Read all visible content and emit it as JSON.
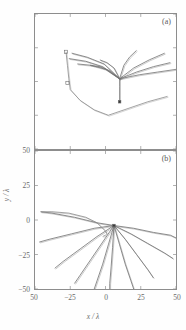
{
  "figure": {
    "panels": [
      {
        "id": "a",
        "label": "(a)"
      },
      {
        "id": "b",
        "label": "(b)"
      }
    ]
  },
  "axes": {
    "xlabel": "x / λ",
    "ylabel": "y / λ",
    "xticks": [
      "50",
      "−25",
      "0",
      "25",
      "50"
    ],
    "yticks": [
      "50",
      "25",
      "0",
      "−25",
      "−50"
    ],
    "xlim": [
      -50,
      50
    ],
    "ylim": [
      -50,
      50
    ],
    "grid": false,
    "tick_color": "#6a6a6a",
    "frame_color": "#8d8d8d"
  },
  "chart_data": {
    "type": "line",
    "title": "",
    "xlabel": "x / λ",
    "ylabel": "y / λ",
    "xlim": [
      -50,
      50
    ],
    "ylim": [
      -50,
      50
    ],
    "grid": false,
    "legend": "none",
    "panels": [
      {
        "id": "a",
        "label": "(a)",
        "source_point": {
          "x": 10,
          "y": 2
        },
        "series": [
          {
            "name": "ray-a1",
            "color": "#707070",
            "x": [
              10,
              -2,
              -14,
              -26
            ],
            "y": [
              2,
              11,
              15,
              17
            ]
          },
          {
            "name": "ray-a2",
            "color": "#707070",
            "x": [
              10,
              -1,
              -13,
              -24
            ],
            "y": [
              2,
              13,
              18,
              21
            ]
          },
          {
            "name": "ray-a3",
            "color": "#707070",
            "x": [
              10,
              0,
              -10,
              -20
            ],
            "y": [
              2,
              9,
              12,
              13
            ]
          },
          {
            "name": "ray-a4",
            "color": "#707070",
            "x": [
              10,
              3,
              -4,
              -11
            ],
            "y": [
              2,
              8,
              11,
              12
            ]
          },
          {
            "name": "ray-a5",
            "color": "#707070",
            "x": [
              10,
              6,
              1,
              -4
            ],
            "y": [
              2,
              10,
              14,
              16
            ]
          },
          {
            "name": "ray-a6",
            "color": "#707070",
            "x": [
              10,
              13,
              17,
              22
            ],
            "y": [
              2,
              12,
              18,
              23
            ]
          },
          {
            "name": "ray-a7",
            "color": "#707070",
            "x": [
              10,
              20,
              31,
              42
            ],
            "y": [
              2,
              10,
              16,
              21
            ]
          },
          {
            "name": "ray-a8",
            "color": "#707070",
            "x": [
              10,
              22,
              34,
              46
            ],
            "y": [
              2,
              7,
              11,
              14
            ]
          },
          {
            "name": "ray-a9",
            "color": "#707070",
            "x": [
              10,
              24,
              37,
              50
            ],
            "y": [
              2,
              5,
              7,
              9
            ]
          },
          {
            "name": "ray-a10",
            "color": "#707070",
            "x": [
              10,
              10,
              10,
              10
            ],
            "y": [
              2,
              -4,
              -10,
              -15
            ]
          },
          {
            "name": "traj-a-left",
            "color": "#8a8a8a",
            "x": [
              -28,
              -27,
              -26,
              -25
            ],
            "y": [
              22,
              12,
              2,
              -6
            ]
          },
          {
            "name": "traj-a-fold",
            "color": "#8a8a8a",
            "x": [
              -25,
              -18,
              -8,
              2
            ],
            "y": [
              -6,
              -14,
              -21,
              -25
            ]
          },
          {
            "name": "traj-a-right",
            "color": "#8a8a8a",
            "x": [
              2,
              16,
              30,
              44
            ],
            "y": [
              -25,
              -20,
              -15,
              -11
            ]
          }
        ],
        "markers": [
          {
            "name": "source-marker",
            "x": 10,
            "y": -15,
            "shape": "square",
            "filled": true
          },
          {
            "name": "open-square-1",
            "x": -28,
            "y": 22,
            "shape": "square",
            "filled": false
          },
          {
            "name": "open-square-2",
            "x": -27,
            "y": -1,
            "shape": "square",
            "filled": false
          }
        ]
      },
      {
        "id": "b",
        "label": "(b)",
        "source_point": {
          "x": 6,
          "y": -4
        },
        "series": [
          {
            "name": "ray-b1",
            "color": "#6e6e6e",
            "x": [
              6,
              -6,
              -22,
              -38,
              -46
            ],
            "y": [
              -4,
              -2,
              2,
              5,
              6
            ]
          },
          {
            "name": "ray-b2",
            "color": "#6e6e6e",
            "x": [
              6,
              -8,
              -24,
              -40,
              -47
            ],
            "y": [
              -4,
              -6,
              -10,
              -14,
              -16
            ]
          },
          {
            "name": "ray-b3",
            "color": "#6e6e6e",
            "x": [
              6,
              -6,
              -18,
              -30,
              -36
            ],
            "y": [
              -4,
              -12,
              -21,
              -30,
              -35
            ]
          },
          {
            "name": "ray-b4",
            "color": "#6e6e6e",
            "x": [
              6,
              -2,
              -10,
              -18,
              -22
            ],
            "y": [
              -4,
              -16,
              -28,
              -40,
              -46
            ]
          },
          {
            "name": "ray-b5",
            "color": "#6e6e6e",
            "x": [
              6,
              2,
              -2,
              -6,
              -8
            ],
            "y": [
              -4,
              -18,
              -32,
              -44,
              -50
            ]
          },
          {
            "name": "ray-b6",
            "color": "#6e6e6e",
            "x": [
              6,
              5,
              4,
              3,
              3
            ],
            "y": [
              -4,
              -20,
              -34,
              -46,
              -50
            ]
          },
          {
            "name": "ray-b7",
            "color": "#6e6e6e",
            "x": [
              6,
              10,
              14,
              18,
              20
            ],
            "y": [
              -4,
              -18,
              -32,
              -44,
              -50
            ]
          },
          {
            "name": "ray-b8",
            "color": "#6e6e6e",
            "x": [
              6,
              14,
              22,
              30,
              34
            ],
            "y": [
              -4,
              -14,
              -25,
              -36,
              -42
            ]
          },
          {
            "name": "ray-b9",
            "color": "#6e6e6e",
            "x": [
              6,
              18,
              30,
              42,
              48
            ],
            "y": [
              -4,
              -10,
              -17,
              -24,
              -28
            ]
          },
          {
            "name": "ray-b10",
            "color": "#6e6e6e",
            "x": [
              6,
              20,
              34,
              46,
              50
            ],
            "y": [
              -4,
              -6,
              -9,
              -11,
              -13
            ]
          },
          {
            "name": "caustic-left",
            "color": "#8a8a8a",
            "x": [
              -46,
              -38,
              -26,
              -14,
              -6,
              -2
            ],
            "y": [
              6,
              6,
              5,
              2,
              -2,
              -6
            ]
          },
          {
            "name": "caustic-fold",
            "color": "#8a8a8a",
            "x": [
              -2,
              0,
              1,
              0,
              -2
            ],
            "y": [
              -6,
              -8,
              -10,
              -11,
              -12
            ]
          }
        ],
        "markers": [
          {
            "name": "source-marker",
            "x": 6,
            "y": -4,
            "shape": "square",
            "filled": true
          }
        ]
      }
    ]
  }
}
